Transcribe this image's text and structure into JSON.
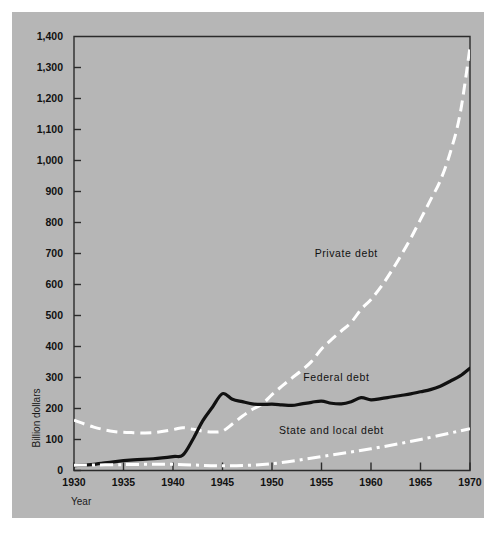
{
  "figure": {
    "background_color": "#ffffff",
    "panel_color": "#b6b6b6",
    "frame_color": "#2b2b2b"
  },
  "chart_data": {
    "type": "line",
    "title": "",
    "xlabel": "Year",
    "ylabel": "Billion dollars",
    "xlim": [
      1930,
      1970
    ],
    "ylim": [
      0,
      1400
    ],
    "grid": false,
    "legend_position": "inline-annotations",
    "x_ticks": [
      1930,
      1935,
      1940,
      1945,
      1950,
      1955,
      1960,
      1965,
      1970
    ],
    "x_tick_labels": [
      "1930",
      "1935",
      "1940",
      "1945",
      "1950",
      "1955",
      "1960",
      "1965",
      "1970"
    ],
    "y_ticks": [
      0,
      100,
      200,
      300,
      400,
      500,
      600,
      700,
      800,
      900,
      1000,
      1100,
      1200,
      1300,
      1400
    ],
    "y_tick_labels": [
      "0",
      "100",
      "200",
      "300",
      "400",
      "500",
      "600",
      "700",
      "800",
      "900",
      "1,000",
      "1,100",
      "1,200",
      "1,300",
      "1,400"
    ],
    "series": [
      {
        "name": "Private debt",
        "style": "dashed",
        "color": "#ffffff",
        "label_x": 1957.5,
        "label_y": 690,
        "x": [
          1930,
          1932,
          1934,
          1936,
          1938,
          1940,
          1941,
          1942,
          1943,
          1944,
          1945,
          1946,
          1947,
          1948,
          1949,
          1950,
          1951,
          1952,
          1953,
          1954,
          1955,
          1956,
          1957,
          1958,
          1959,
          1960,
          1961,
          1962,
          1963,
          1964,
          1965,
          1966,
          1967,
          1968,
          1969,
          1970
        ],
        "y": [
          162,
          140,
          126,
          122,
          122,
          132,
          138,
          133,
          127,
          124,
          127,
          150,
          175,
          197,
          214,
          245,
          272,
          298,
          323,
          352,
          392,
          422,
          450,
          478,
          520,
          552,
          592,
          640,
          692,
          748,
          810,
          872,
          935,
          1025,
          1150,
          1365
        ]
      },
      {
        "name": "Federal debt",
        "style": "solid",
        "color": "#111111",
        "label_x": 1956.5,
        "label_y": 290,
        "x": [
          1930,
          1932,
          1934,
          1936,
          1938,
          1940,
          1941,
          1942,
          1943,
          1944,
          1945,
          1946,
          1947,
          1948,
          1949,
          1950,
          1951,
          1952,
          1953,
          1954,
          1955,
          1956,
          1957,
          1958,
          1959,
          1960,
          1961,
          1962,
          1963,
          1964,
          1965,
          1966,
          1967,
          1968,
          1969,
          1970
        ],
        "y": [
          16,
          20,
          28,
          34,
          38,
          45,
          50,
          100,
          160,
          205,
          248,
          230,
          222,
          215,
          213,
          214,
          212,
          210,
          215,
          220,
          224,
          217,
          215,
          222,
          235,
          228,
          232,
          237,
          242,
          247,
          254,
          261,
          272,
          288,
          305,
          330
        ]
      },
      {
        "name": "State and local debt",
        "style": "dash-dot",
        "color": "#ffffff",
        "label_x": 1956.0,
        "label_y": 118,
        "x": [
          1930,
          1935,
          1940,
          1945,
          1950,
          1955,
          1960,
          1965,
          1970
        ],
        "y": [
          17,
          19,
          20,
          15,
          22,
          45,
          70,
          100,
          135
        ]
      }
    ]
  }
}
